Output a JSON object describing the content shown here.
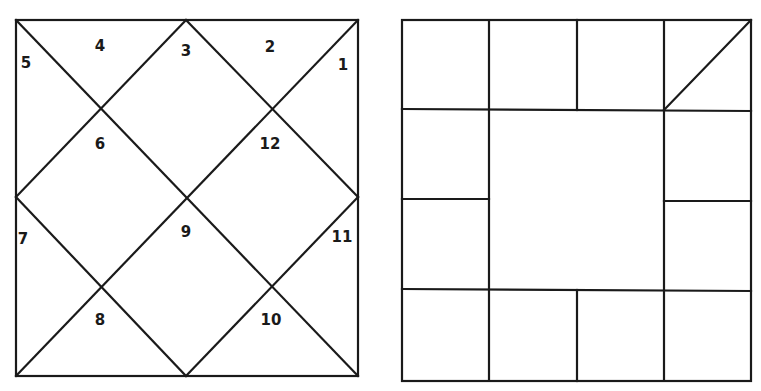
{
  "north_indian_chart": {
    "houses": [
      {
        "number": "1",
        "x": 343,
        "y": 65
      },
      {
        "number": "2",
        "x": 270,
        "y": 47
      },
      {
        "number": "3",
        "x": 186,
        "y": 51
      },
      {
        "number": "4",
        "x": 100,
        "y": 46
      },
      {
        "number": "5",
        "x": 26,
        "y": 63
      },
      {
        "number": "6",
        "x": 100,
        "y": 144
      },
      {
        "number": "7",
        "x": 23,
        "y": 239
      },
      {
        "number": "8",
        "x": 100,
        "y": 320
      },
      {
        "number": "9",
        "x": 186,
        "y": 232
      },
      {
        "number": "10",
        "x": 271,
        "y": 320
      },
      {
        "number": "11",
        "x": 342,
        "y": 237
      },
      {
        "number": "12",
        "x": 270,
        "y": 144
      }
    ]
  },
  "south_indian_chart": {
    "grid": "4x4",
    "outer_cells": 12,
    "center": "empty",
    "marked_cell": "top-right (diagonal)"
  },
  "colors": {
    "line": "#1a1a1a",
    "background": "#ffffff"
  }
}
